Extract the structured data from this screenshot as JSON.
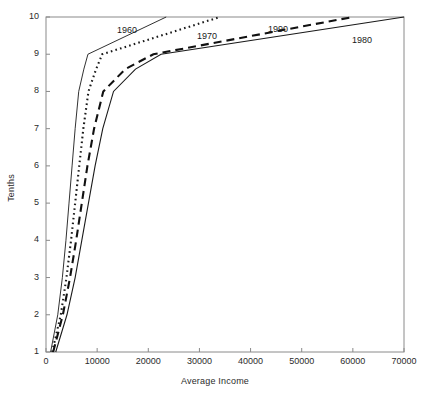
{
  "chart_data": {
    "type": "line",
    "title": "",
    "xlabel": "Average Income",
    "ylabel": "Tenths",
    "xlim": [
      0,
      70000
    ],
    "ylim": [
      1,
      10
    ],
    "xticks": [
      0,
      10000,
      20000,
      30000,
      40000,
      50000,
      60000,
      70000
    ],
    "xtick_labels": [
      "0",
      "10000",
      "20000",
      "30000",
      "40000",
      "50000",
      "60000",
      "70000"
    ],
    "yticks": [
      1,
      2,
      3,
      4,
      5,
      6,
      7,
      8,
      9,
      10
    ],
    "ytick_labels": [
      "1",
      "2",
      "3",
      "4",
      "5",
      "6",
      "7",
      "8",
      "9",
      "10"
    ],
    "grid": false,
    "legend_position": "inline-annotations",
    "series": [
      {
        "name": "1960",
        "style": "solid-thin",
        "color": "#1a1a1a",
        "annotation": "1960",
        "x": [
          900,
          2300,
          3200,
          3900,
          4500,
          5100,
          5700,
          6400,
          7400,
          8200,
          23500
        ],
        "y": [
          1,
          2,
          3,
          4,
          5,
          6,
          7,
          8,
          8.6,
          9,
          10
        ]
      },
      {
        "name": "1970",
        "style": "dotted",
        "color": "#1a1a1a",
        "annotation": "1970",
        "x": [
          1200,
          2900,
          4000,
          4900,
          5700,
          6500,
          7300,
          8300,
          9800,
          11000,
          34000
        ],
        "y": [
          1,
          2,
          3,
          4,
          5,
          6,
          7,
          8,
          8.6,
          9,
          10
        ]
      },
      {
        "name": "1990",
        "style": "dashed",
        "color": "#111111",
        "annotation": "1990",
        "x": [
          1400,
          3300,
          4700,
          5900,
          7000,
          8100,
          9400,
          11200,
          15500,
          21000,
          60000
        ],
        "y": [
          1,
          2,
          3,
          4,
          5,
          6,
          7,
          8,
          8.6,
          9,
          10
        ]
      },
      {
        "name": "1980",
        "style": "solid",
        "color": "#1a1a1a",
        "annotation": "1980",
        "x": [
          1900,
          4100,
          5700,
          7000,
          8300,
          9600,
          11100,
          13200,
          17500,
          22500,
          70000
        ],
        "y": [
          1,
          2,
          3,
          4,
          5,
          6,
          7,
          8,
          8.6,
          9,
          10
        ]
      }
    ],
    "annotations": [
      {
        "text": "1960",
        "x_px": 117,
        "y_px": 25
      },
      {
        "text": "1970",
        "x_px": 197,
        "y_px": 31
      },
      {
        "text": "1990",
        "x_px": 268,
        "y_px": 24
      },
      {
        "text": "1980",
        "x_px": 352,
        "y_px": 35
      }
    ]
  }
}
